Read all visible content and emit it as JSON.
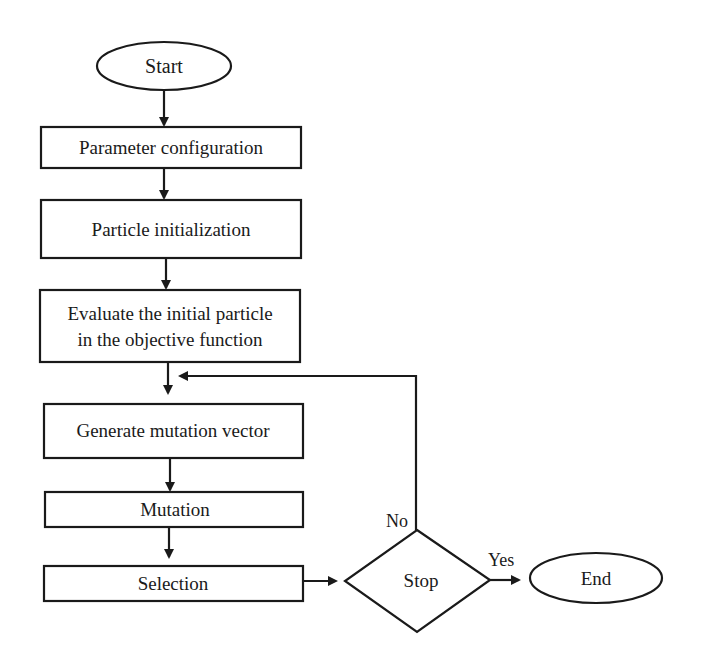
{
  "flowchart": {
    "start": {
      "label": "Start"
    },
    "steps": [
      {
        "label": "Parameter configuration"
      },
      {
        "label": "Particle initialization"
      },
      {
        "label_lines": [
          "Evaluate the initial particle",
          "in the objective function"
        ]
      },
      {
        "label": "Generate mutation vector"
      },
      {
        "label": "Mutation"
      },
      {
        "label": "Selection"
      }
    ],
    "decision": {
      "label": "Stop",
      "yes_label": "Yes",
      "no_label": "No"
    },
    "end": {
      "label": "End"
    }
  },
  "colors": {
    "stroke": "#1a1a1a",
    "background": "#ffffff"
  }
}
